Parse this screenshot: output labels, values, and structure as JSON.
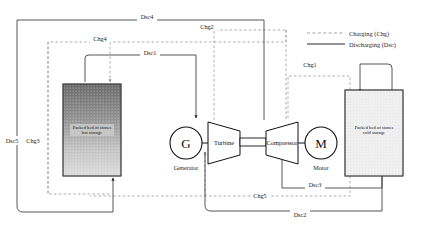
{
  "figure": {
    "caption": ""
  },
  "legend": {
    "items": [
      {
        "label": "Charging (Chg)",
        "style": "dashed",
        "color": "#9a9a9a"
      },
      {
        "label": "Discharging (Dsc)",
        "style": "solid",
        "color": "#2b2b2b"
      }
    ]
  },
  "components": {
    "generator": {
      "symbol": "G",
      "label": "Generator"
    },
    "motor": {
      "symbol": "M",
      "label": "Motor"
    },
    "turbine": {
      "label": "Turbine"
    },
    "compressor": {
      "label": "Compressor"
    },
    "hot_storage": {
      "line1": "Packed bed of stones",
      "line2": "hot storage"
    },
    "cold_storage": {
      "line1": "Packed bed of stones",
      "line2": "cold storage"
    }
  },
  "streams": {
    "charging": [
      {
        "name": "Chg1"
      },
      {
        "name": "Chg2"
      },
      {
        "name": "Chg3"
      },
      {
        "name": "Chg4"
      },
      {
        "name": "Chg5"
      }
    ],
    "discharging": [
      {
        "name": "Dsc1"
      },
      {
        "name": "Dsc2"
      },
      {
        "name": "Dsc3"
      },
      {
        "name": "Dsc4"
      },
      {
        "name": "Dsc5"
      }
    ]
  },
  "colors": {
    "charge_line": "#9a9a9a",
    "discharge_line": "#2b2b2b",
    "hot_top": "#6e6e6e",
    "hot_bottom": "#d8d8d8",
    "cold_fill": "#ededed",
    "outline": "#3a3a3a"
  }
}
